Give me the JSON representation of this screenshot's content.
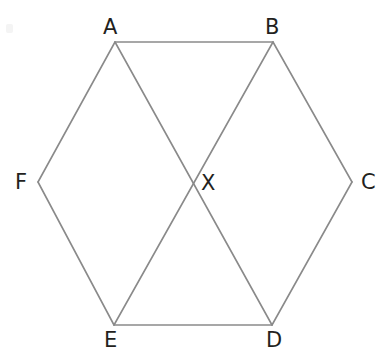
{
  "figure": {
    "type": "geometry-diagram",
    "canvas": {
      "width": 385,
      "height": 359
    },
    "style": {
      "background_color": "#ffffff",
      "line_color": "#8a8a8a",
      "line_width": 1.6,
      "label_color": "#231f20",
      "label_font_size": 21
    },
    "points": [
      {
        "id": "A",
        "label": "A",
        "x": 115,
        "y": 42,
        "label_x": 103,
        "label_y": 17
      },
      {
        "id": "B",
        "label": "B",
        "x": 273,
        "y": 42,
        "label_x": 265,
        "label_y": 17
      },
      {
        "id": "C",
        "label": "C",
        "x": 352,
        "y": 182,
        "label_x": 361,
        "label_y": 172
      },
      {
        "id": "D",
        "label": "D",
        "x": 272,
        "y": 325,
        "label_x": 266,
        "label_y": 330
      },
      {
        "id": "E",
        "label": "E",
        "x": 114,
        "y": 325,
        "label_x": 104,
        "label_y": 330
      },
      {
        "id": "F",
        "label": "F",
        "x": 38,
        "y": 182,
        "label_x": 15,
        "label_y": 172
      },
      {
        "id": "X",
        "label": "X",
        "x": 193,
        "y": 183,
        "label_x": 201,
        "label_y": 173
      }
    ],
    "segments": [
      {
        "id": "AB",
        "from": "A",
        "to": "B",
        "kind": "hexagon-side"
      },
      {
        "id": "BC",
        "from": "B",
        "to": "C",
        "kind": "hexagon-side"
      },
      {
        "id": "CD",
        "from": "C",
        "to": "D",
        "kind": "hexagon-side"
      },
      {
        "id": "DE",
        "from": "D",
        "to": "E",
        "kind": "hexagon-side"
      },
      {
        "id": "EF",
        "from": "E",
        "to": "F",
        "kind": "hexagon-side"
      },
      {
        "id": "FA",
        "from": "F",
        "to": "A",
        "kind": "hexagon-side"
      },
      {
        "id": "AD",
        "from": "A",
        "to": "D",
        "kind": "diagonal"
      },
      {
        "id": "BE",
        "from": "B",
        "to": "E",
        "kind": "diagonal"
      }
    ]
  }
}
